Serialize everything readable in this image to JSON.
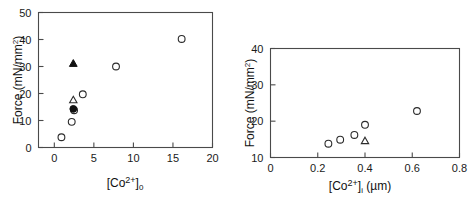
{
  "figure": {
    "background": "#ffffff",
    "panel_count": 2
  },
  "chart_data": [
    {
      "id": "left-panel",
      "type": "scatter",
      "title": "",
      "xlabel": "[Co2+]0",
      "xlabel_parts": {
        "bracket_open": "[",
        "species": "Co",
        "charge": "2+",
        "bracket_close": "]",
        "subscript": "0"
      },
      "ylabel": "Force (mN/mm2)",
      "ylabel_parts": {
        "text": "Force (mN/mm",
        "superscript": "2",
        "tail": ")"
      },
      "xlim": [
        -2,
        20
      ],
      "ylim": [
        0,
        50
      ],
      "xticks": [
        0,
        5,
        10,
        15,
        20
      ],
      "xticklabels": [
        "0",
        "5",
        "10",
        "15",
        "20"
      ],
      "yticks": [
        0,
        10,
        20,
        30,
        40,
        50
      ],
      "yticklabels": [
        "0",
        "10",
        "20",
        "30",
        "40",
        "50"
      ],
      "grid": false,
      "legend": "none",
      "series": [
        {
          "name": "open-circle",
          "marker": "open-circle",
          "color": "#2b2b2b",
          "points": [
            {
              "x": 0.9,
              "y": 3.8
            },
            {
              "x": 2.2,
              "y": 9.5
            },
            {
              "x": 2.5,
              "y": 13.8
            },
            {
              "x": 3.6,
              "y": 19.7
            },
            {
              "x": 7.8,
              "y": 30.0
            },
            {
              "x": 16.1,
              "y": 40.2
            }
          ]
        },
        {
          "name": "open-triangle",
          "marker": "open-triangle",
          "color": "#2b2b2b",
          "points": [
            {
              "x": 2.4,
              "y": 17.5
            }
          ]
        },
        {
          "name": "filled-circle",
          "marker": "filled-circle",
          "color": "#111111",
          "points": [
            {
              "x": 2.4,
              "y": 14.3
            }
          ]
        },
        {
          "name": "filled-triangle",
          "marker": "filled-triangle",
          "color": "#111111",
          "points": [
            {
              "x": 2.4,
              "y": 31.0
            }
          ]
        }
      ]
    },
    {
      "id": "right-panel",
      "type": "scatter",
      "title": "",
      "xlabel": "[Co2+]i (um)",
      "xlabel_parts": {
        "bracket_open": "[",
        "species": "Co",
        "charge": "2+",
        "bracket_close": "]",
        "subscript": "i",
        "units": "(µm)"
      },
      "ylabel": "Force (mN/mm2)",
      "ylabel_parts": {
        "text": "Force (mN/mm",
        "superscript": "2",
        "tail": ")"
      },
      "xlim": [
        0,
        0.8
      ],
      "ylim": [
        10,
        40
      ],
      "xticks": [
        0,
        0.2,
        0.4,
        0.6,
        0.8
      ],
      "xticklabels": [
        "0",
        "0.2",
        "0.4",
        "0.6",
        "0.8"
      ],
      "yticks": [
        10,
        20,
        30,
        40
      ],
      "yticklabels": [
        "10",
        "20",
        "30",
        "40"
      ],
      "grid": false,
      "legend": "none",
      "series": [
        {
          "name": "open-circle",
          "marker": "open-circle",
          "color": "#2b2b2b",
          "points": [
            {
              "x": 0.245,
              "y": 13.8
            },
            {
              "x": 0.295,
              "y": 14.9
            },
            {
              "x": 0.355,
              "y": 16.2
            },
            {
              "x": 0.4,
              "y": 19.0
            },
            {
              "x": 0.62,
              "y": 22.8
            }
          ]
        },
        {
          "name": "open-triangle",
          "marker": "open-triangle",
          "color": "#2b2b2b",
          "points": [
            {
              "x": 0.4,
              "y": 14.5
            }
          ]
        }
      ]
    }
  ]
}
